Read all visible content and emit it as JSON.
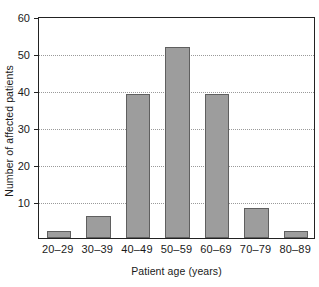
{
  "chart_data": {
    "type": "bar",
    "title": "",
    "subtitle": "",
    "xlabel": "Patient age (years)",
    "ylabel": "Number of affected patients",
    "categories": [
      "20–29",
      "30–39",
      "40–49",
      "50–59",
      "60–69",
      "70–79",
      "80–89"
    ],
    "values": [
      2,
      6,
      39,
      51.5,
      39,
      8,
      2
    ],
    "ylim": [
      0,
      60
    ],
    "yticks": [
      0,
      10,
      20,
      30,
      40,
      50,
      60
    ],
    "ytick_labels": [
      "",
      "10",
      "20",
      "30",
      "40",
      "50",
      "60"
    ],
    "grid": "horizontal-dotted",
    "legend": "none",
    "bar_fill": "#9d9d9d",
    "bar_edge": "#5f5f5f",
    "axis_color": "#222222",
    "grid_color": "#9a9a9a",
    "background": "#ffffff"
  }
}
